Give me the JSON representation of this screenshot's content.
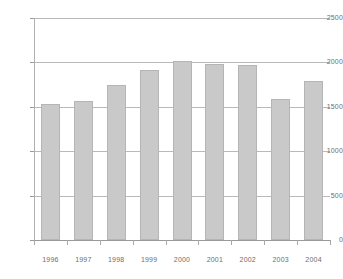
{
  "chart_data": {
    "type": "bar",
    "title": "",
    "subtitle": "",
    "xlabel": "",
    "ylabel": "",
    "categories": [
      "1996",
      "1997",
      "1998",
      "1999",
      "2000",
      "2001",
      "2002",
      "2003",
      "2004"
    ],
    "values": [
      1530,
      1570,
      1750,
      1920,
      2020,
      1985,
      1975,
      1590,
      1790
    ],
    "ylim": [
      0,
      2500
    ],
    "yticks": [
      0,
      500,
      1000,
      1500,
      2000,
      2500
    ],
    "ytick_labels": [
      "0",
      "500",
      "1000",
      "1500",
      "2000",
      "2500"
    ],
    "grid": true,
    "grid_axis": "y",
    "legend": false,
    "bar_color": "#c9c9c9",
    "bar_edge_color": "#b5b5b5",
    "grid_color": "#b9b9b9",
    "axis_color": "#9a9a9a",
    "text_color": "#6e6e6e"
  }
}
